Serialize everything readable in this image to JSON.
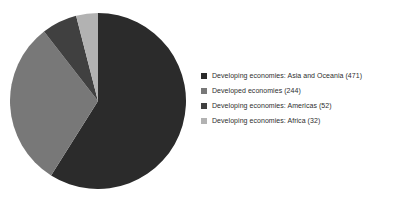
{
  "chart_data": {
    "type": "pie",
    "title": "",
    "subtitle": "",
    "xlabel": "",
    "ylabel": "",
    "grid": false,
    "legend_position": "right",
    "start_angle_deg": 0,
    "direction": "clockwise",
    "total": 799,
    "categories": [
      "Developing economies: Asia and Oceania",
      "Developed economies",
      "Developing economies: Americas",
      "Developing economies: Africa"
    ],
    "values": [
      471,
      244,
      52,
      32
    ],
    "slices": [
      {
        "label": "Developing economies: Asia and Oceania",
        "value": 471,
        "legend_text": "Developing economies: Asia and Oceania (471)",
        "color": "#2b2b2b",
        "angle_deg": 212.2,
        "percent": 58.9
      },
      {
        "label": "Developed economies",
        "value": 244,
        "legend_text": "Developed economies (244)",
        "color": "#787878",
        "angle_deg": 109.9,
        "percent": 30.5
      },
      {
        "label": "Developing economies: Americas",
        "value": 52,
        "legend_text": "Developing economies: Americas (52)",
        "color": "#404040",
        "angle_deg": 23.4,
        "percent": 6.5
      },
      {
        "label": "Developing economies: Africa",
        "value": 32,
        "legend_text": "Developing economies: Africa (32)",
        "color": "#b2b2b2",
        "angle_deg": 14.4,
        "percent": 4.0
      }
    ]
  },
  "legend": {
    "items": [
      {
        "text": "Developing economies: Asia and Oceania (471)",
        "color": "#2b2b2b"
      },
      {
        "text": "Developed economies (244)",
        "color": "#787878"
      },
      {
        "text": "Developing economies: Americas (52)",
        "color": "#404040"
      },
      {
        "text": "Developing economies: Africa (32)",
        "color": "#b2b2b2"
      }
    ]
  },
  "colors": {
    "background": "#ffffff",
    "text": "#2e2e2e"
  }
}
